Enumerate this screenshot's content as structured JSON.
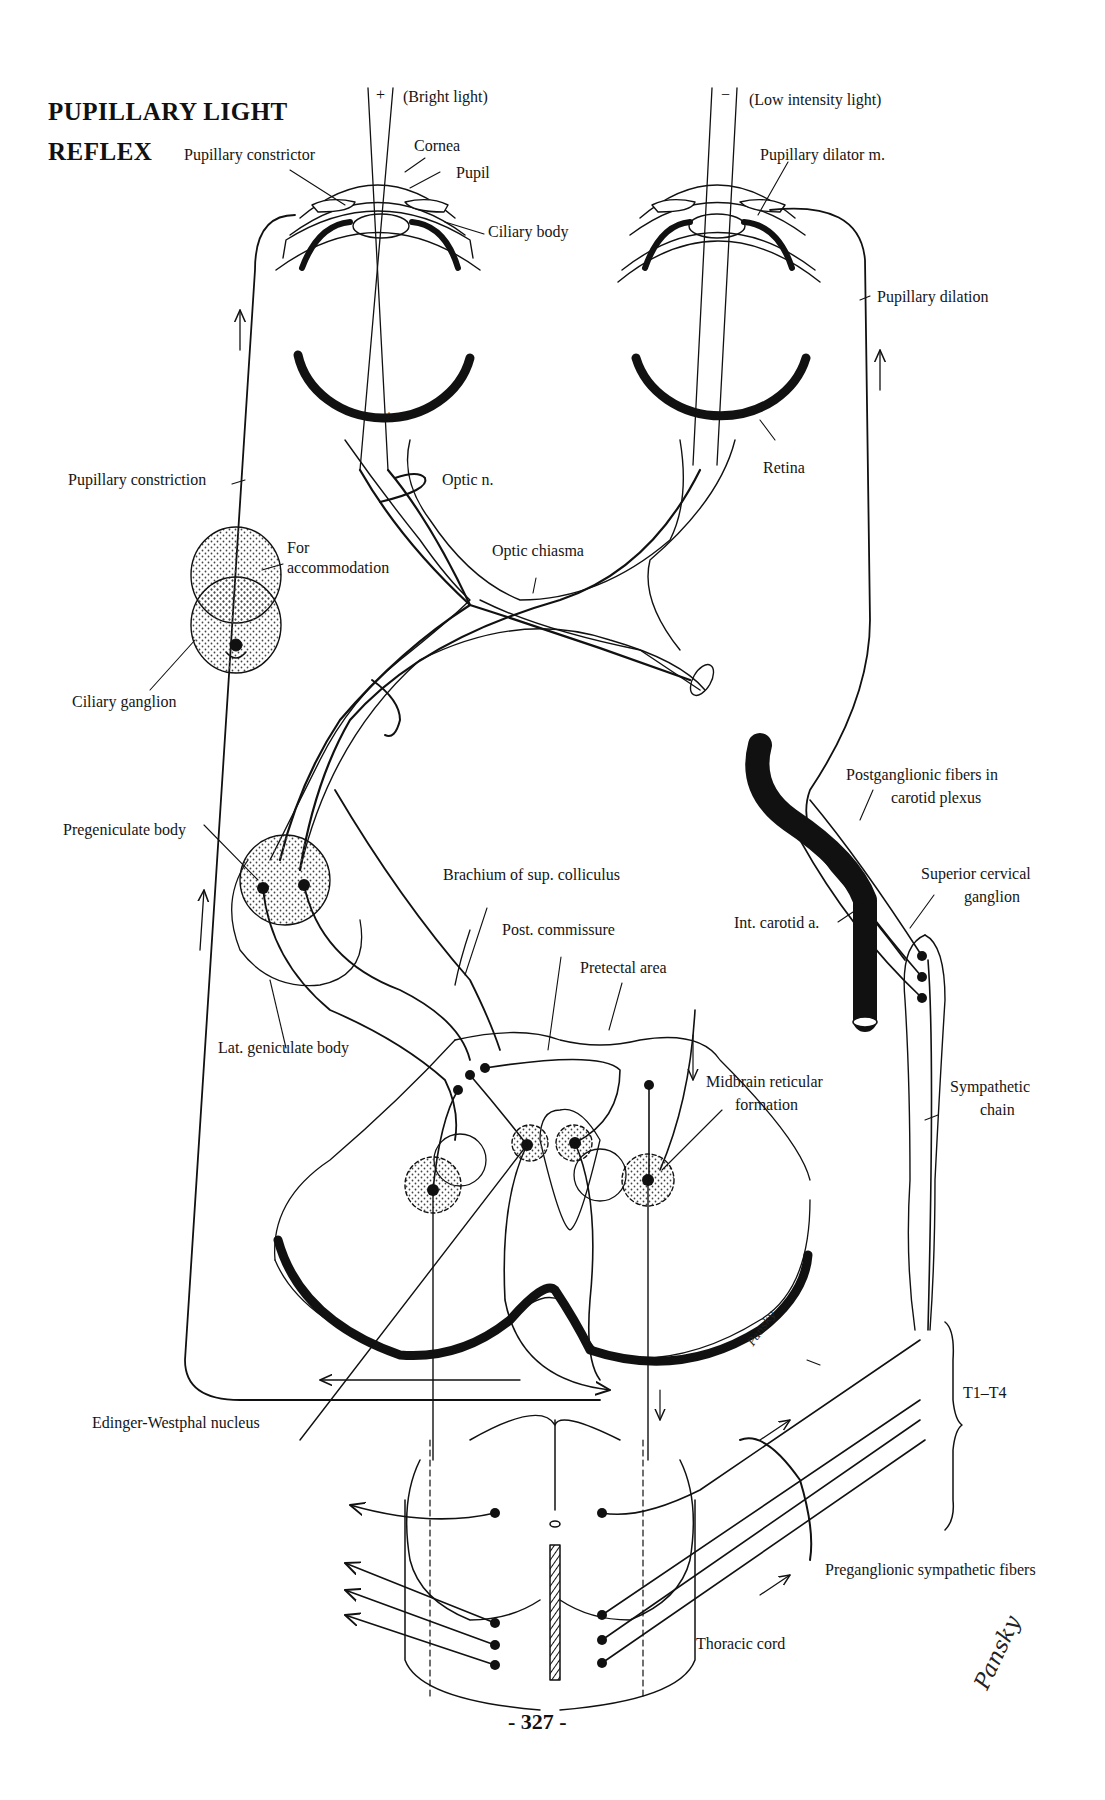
{
  "figure": {
    "title_line1": "PUPILLARY LIGHT",
    "title_line2": "REFLEX",
    "page_number": "- 327 -",
    "artist_signature": "Pansky",
    "ink_color": "#111111",
    "paper_color": "#ffffff",
    "stipple_color": "#555555"
  },
  "light_inputs": {
    "bright": {
      "sign": "+",
      "label": "(Bright light)",
      "retina_sign": "+"
    },
    "low": {
      "sign": "−",
      "label": "(Low intensity light)",
      "retina_sign": "−"
    }
  },
  "labels": {
    "pupillary_constrictor": "Pupillary constrictor",
    "cornea": "Cornea",
    "pupil": "Pupil",
    "ciliary_body": "Ciliary body",
    "pupillary_dilator": "Pupillary dilator m.",
    "pupillary_dilation": "Pupillary dilation",
    "retina": "Retina",
    "pupillary_constriction": "Pupillary constriction",
    "optic_nerve": "Optic n.",
    "for_accommodation_1": "For",
    "for_accommodation_2": "accommodation",
    "optic_chiasma": "Optic chiasma",
    "ciliary_ganglion": "Ciliary ganglion",
    "postganglionic_1": "Postganglionic fibers in",
    "postganglionic_2": "carotid plexus",
    "pregeniculate_body": "Pregeniculate body",
    "brachium": "Brachium of sup. colliculus",
    "superior_cervical_1": "Superior cervical",
    "superior_cervical_2": "ganglion",
    "post_commissure": "Post. commissure",
    "int_carotid": "Int. carotid a.",
    "pretectal_area": "Pretectal area",
    "lat_geniculate": "Lat. geniculate body",
    "midbrain_reticular_1": "Midbrain reticular",
    "midbrain_reticular_2": "formation",
    "sympathetic_chain_1": "Sympathetic",
    "sympathetic_chain_2": "chain",
    "t1_t4": "T1–T4",
    "edinger_westphal": "Edinger-Westphal nucleus",
    "preganglionic": "Preganglionic sympathetic fibers",
    "thoracic_cord": "Thoracic cord"
  }
}
